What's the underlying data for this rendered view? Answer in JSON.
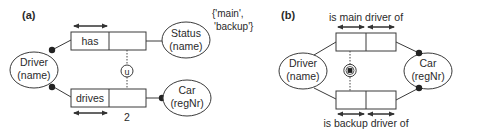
{
  "panel_a": {
    "label": "(a)",
    "entities": {
      "driver": {
        "name": "Driver",
        "refmode": "(name)"
      },
      "status": {
        "name": "Status",
        "refmode": "(name)"
      },
      "car": {
        "name": "Car",
        "refmode": "(regNr)"
      }
    },
    "fact_types": {
      "has": {
        "reading": "has"
      },
      "drives": {
        "reading": "drives"
      }
    },
    "value_constraint": {
      "line1": "{'main',",
      "line2": "'backup'}"
    },
    "subset_constraint_symbol": "u",
    "frequency_constraint": "2"
  },
  "panel_b": {
    "label": "(b)",
    "entities": {
      "driver": {
        "name": "Driver",
        "refmode": "(name)"
      },
      "car": {
        "name": "Car",
        "refmode": "(regNr)"
      }
    },
    "fact_types": {
      "main": {
        "reading": "is main driver of"
      },
      "backup": {
        "reading": "is backup driver of"
      }
    },
    "exclusion_constraint_symbol": "exclusive-or"
  }
}
